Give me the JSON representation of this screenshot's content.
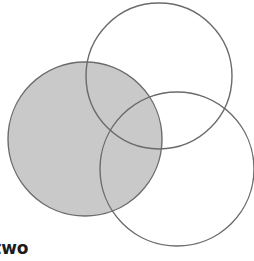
{
  "figure": {
    "type": "venn-diagram",
    "width": 254,
    "height": 261,
    "background_color": "#ffffff",
    "outline_color": "#6b6b6b",
    "outline_width": 1.4,
    "shaded_fill_color": "#c9c9c9",
    "caption": {
      "text": "two",
      "color": "#1c1c1c",
      "clipped_left": true
    },
    "circles": [
      {
        "id": "left-circle",
        "name": "shaded-left-circle",
        "cx": 85,
        "cy": 139,
        "r": 77,
        "filled": true,
        "fill": "#c9c9c9",
        "stroke": "#6b6b6b"
      },
      {
        "id": "top-right-circle",
        "name": "outline-top-right-circle",
        "cx": 159,
        "cy": 76,
        "r": 73,
        "filled": false,
        "fill": "none",
        "stroke": "#6b6b6b"
      },
      {
        "id": "bottom-right-circle",
        "name": "outline-bottom-right-circle",
        "cx": 177,
        "cy": 169,
        "r": 77,
        "filled": false,
        "fill": "none",
        "stroke": "#6b6b6b"
      }
    ]
  }
}
